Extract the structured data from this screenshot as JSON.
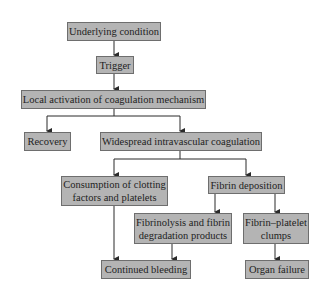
{
  "diagram": {
    "type": "flowchart",
    "colors": {
      "box_fill": "#b4b4b4",
      "box_border": "#6e6e6e",
      "line": "#2a2a2a",
      "text": "#1e1e1e",
      "background": "#ffffff"
    },
    "nodes": [
      {
        "id": "underlying",
        "lines": [
          "Underlying condition"
        ]
      },
      {
        "id": "trigger",
        "lines": [
          "Trigger"
        ]
      },
      {
        "id": "local",
        "lines": [
          "Local activation of coagulation mechanism"
        ]
      },
      {
        "id": "recovery",
        "lines": [
          "Recovery"
        ]
      },
      {
        "id": "widespread",
        "lines": [
          "Widespread intravascular coagulation"
        ]
      },
      {
        "id": "consumption",
        "lines": [
          "Consumption of clotting",
          "factors and platelets"
        ]
      },
      {
        "id": "fibrin_deposition",
        "lines": [
          "Fibrin deposition"
        ]
      },
      {
        "id": "fibrinolysis",
        "lines": [
          "Fibrinolysis and fibrin",
          "degradation products"
        ]
      },
      {
        "id": "clumps",
        "lines": [
          "Fibrin–platelet",
          "clumps"
        ]
      },
      {
        "id": "bleeding",
        "lines": [
          "Continued bleeding"
        ]
      },
      {
        "id": "organ_failure",
        "lines": [
          "Organ failure"
        ]
      }
    ],
    "edges": [
      [
        "underlying",
        "trigger"
      ],
      [
        "trigger",
        "local"
      ],
      [
        "local",
        "recovery"
      ],
      [
        "local",
        "widespread"
      ],
      [
        "widespread",
        "consumption"
      ],
      [
        "widespread",
        "fibrin_deposition"
      ],
      [
        "fibrin_deposition",
        "fibrinolysis"
      ],
      [
        "fibrin_deposition",
        "clumps"
      ],
      [
        "consumption",
        "bleeding"
      ],
      [
        "fibrinolysis",
        "bleeding"
      ],
      [
        "clumps",
        "organ_failure"
      ]
    ]
  }
}
